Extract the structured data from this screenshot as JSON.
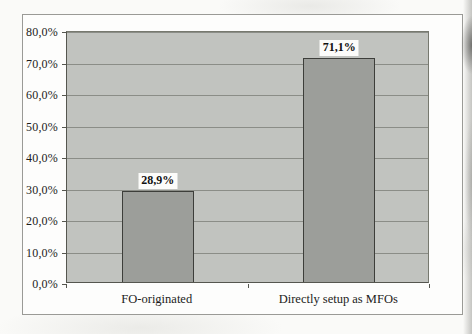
{
  "page": {
    "kind": "scanned bar chart figure"
  },
  "chart_data": {
    "type": "bar",
    "categories": [
      "FO-originated",
      "Directly setup as MFOs"
    ],
    "values": [
      28.9,
      71.1
    ],
    "value_labels": [
      "28,9%",
      "71,1%"
    ],
    "title": "",
    "xlabel": "",
    "ylabel": "",
    "ylim": [
      0,
      80
    ],
    "ytick_step": 10,
    "ytick_labels": [
      "0,0%",
      "10,0%",
      "20,0%",
      "30,0%",
      "40,0%",
      "50,0%",
      "60,0%",
      "70,0%",
      "80,0%"
    ],
    "grid": "horizontal",
    "legend": "none",
    "decimal_separator": ","
  },
  "colors": {
    "paper": "#fafaf8",
    "frame_fill": "#fdfdfc",
    "frame_border": "#9a9a96",
    "plot_fill": "#c1c3bf",
    "gridline": "#8b8d87",
    "axis": "#55564f",
    "bar_fill": "#9c9e9a",
    "bar_border": "#3d3e3a",
    "text": "#1c1c1a",
    "value_label_bg": "#fcfcfa"
  }
}
